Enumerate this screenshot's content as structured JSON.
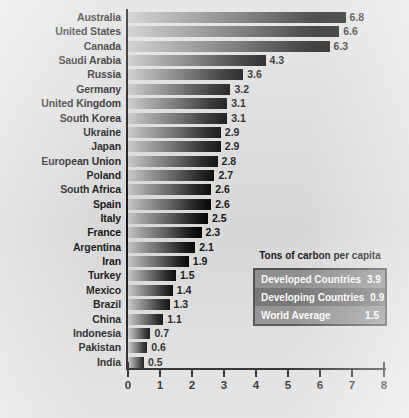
{
  "chart_data": {
    "type": "bar",
    "orientation": "horizontal",
    "title": "",
    "xlabel": "",
    "ylabel": "",
    "xlim": [
      0,
      8
    ],
    "grid": false,
    "xticks": [
      0,
      1,
      2,
      3,
      4,
      5,
      6,
      7,
      8
    ],
    "categories": [
      "Australia",
      "United States",
      "Canada",
      "Saudi Arabia",
      "Russia",
      "Germany",
      "United Kingdom",
      "South Korea",
      "Ukraine",
      "Japan",
      "European Union",
      "Poland",
      "South Africa",
      "Spain",
      "Italy",
      "France",
      "Argentina",
      "Iran",
      "Turkey",
      "Mexico",
      "Brazil",
      "China",
      "Indonesia",
      "Pakistan",
      "India"
    ],
    "values": [
      6.8,
      6.6,
      6.3,
      4.3,
      3.6,
      3.2,
      3.1,
      3.1,
      2.9,
      2.9,
      2.8,
      2.7,
      2.6,
      2.6,
      2.5,
      2.3,
      2.1,
      1.9,
      1.5,
      1.4,
      1.3,
      1.1,
      0.7,
      0.6,
      0.5
    ],
    "value_labels": [
      "6.8",
      "6.6",
      "6.3",
      "4.3",
      "3.6",
      "3.2",
      "3.1",
      "3.1",
      "2.9",
      "2.9",
      "2.8",
      "2.7",
      "2.6",
      "2.6",
      "2.5",
      "2.3",
      "2.1",
      "1.9",
      "1.5",
      "1.4",
      "1.3",
      "1.1",
      "0.7",
      "0.6",
      "0.5"
    ]
  },
  "legend": {
    "title": "Tons of carbon per capita",
    "position": "inside-bottom-right",
    "rows": [
      {
        "label": "Developed Countries",
        "value": "3.9"
      },
      {
        "label": "Developing Countries",
        "value": "0.9"
      },
      {
        "label": "World Average",
        "value": "1.5"
      }
    ]
  },
  "colors": {
    "background": "#dedede",
    "axis": "#111111",
    "text": "#111111",
    "bar_light": "#c8c8c8",
    "bar_dark": "#000000",
    "legend_border": "#4a4a4a",
    "legend_row_light": "#8d8d8d",
    "legend_row_dark": "#6e6e6e",
    "legend_text": "#ffffff"
  }
}
